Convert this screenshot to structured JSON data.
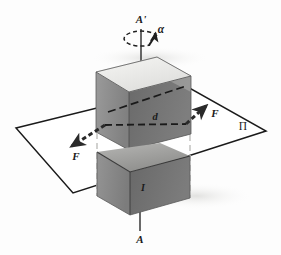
{
  "figure": {
    "background_color": "#fdfdfd",
    "width": 281,
    "height": 255
  },
  "labels": {
    "axis_top": "A'",
    "axis_bottom": "A",
    "angle": "α",
    "force_left": "F",
    "force_right": "F",
    "distance": "d",
    "current": "I",
    "plane": "Π"
  },
  "label_positions": {
    "axis_top": {
      "x": 141,
      "y": 20,
      "size": 11
    },
    "axis_bottom": {
      "x": 140,
      "y": 240,
      "size": 11
    },
    "angle": {
      "x": 159,
      "y": 31,
      "size": 11
    },
    "force_left": {
      "x": 76,
      "y": 157,
      "size": 11
    },
    "force_right": {
      "x": 215,
      "y": 115,
      "size": 11
    },
    "distance": {
      "x": 155,
      "y": 119,
      "size": 11
    },
    "current": {
      "x": 143,
      "y": 189,
      "size": 10
    },
    "plane": {
      "x": 243,
      "y": 127,
      "size": 11
    }
  },
  "colors": {
    "outline": "#1a1a1a",
    "box_top_face": "#e8e8e6",
    "box_top_face_highlight": "#f2f2f0",
    "box_front_left_face": "#8c8c8c",
    "box_front_right_face": "#6e6e6e",
    "box_inner_back_left": "#9a9a9a",
    "box_inner_back_right": "#7a7a7a",
    "box_inner_floor": "#b4b4b2",
    "box_lower_front_left": "#8a8a8a",
    "box_lower_front_right": "#6a6a6a",
    "box_lower_inner": "#a6a6a4",
    "plane_fill": "#ffffff",
    "plane_stroke": "#1a1a1a",
    "guide_dash": "#c9c9c7",
    "hidden_dash": "#1a1a1a",
    "arrow_fill": "#2a2a2a",
    "axis_line": "#2a2a2a",
    "shadow": "#e4e4e2"
  },
  "geometry": {
    "axis": {
      "top_point": {
        "x": 141,
        "y": 29
      },
      "bottom_point": {
        "x": 140,
        "y": 231
      }
    },
    "plane_polygon": [
      {
        "x": 16,
        "y": 128
      },
      {
        "x": 186,
        "y": 86
      },
      {
        "x": 266,
        "y": 131
      },
      {
        "x": 73,
        "y": 193
      }
    ],
    "box_upper": {
      "top_face": [
        {
          "x": 96,
          "y": 72
        },
        {
          "x": 157,
          "y": 57
        },
        {
          "x": 191,
          "y": 76
        },
        {
          "x": 129,
          "y": 92
        }
      ],
      "front_left_face": [
        {
          "x": 96,
          "y": 72
        },
        {
          "x": 129,
          "y": 92
        },
        {
          "x": 129,
          "y": 150
        },
        {
          "x": 96,
          "y": 132
        }
      ],
      "front_right_face": [
        {
          "x": 129,
          "y": 92
        },
        {
          "x": 191,
          "y": 76
        },
        {
          "x": 191,
          "y": 134
        },
        {
          "x": 129,
          "y": 150
        }
      ]
    },
    "box_lower": {
      "front_left_face": [
        {
          "x": 96,
          "y": 152
        },
        {
          "x": 129,
          "y": 172
        },
        {
          "x": 129,
          "y": 215
        },
        {
          "x": 96,
          "y": 196
        }
      ],
      "front_right_face": [
        {
          "x": 129,
          "y": 172
        },
        {
          "x": 191,
          "y": 156
        },
        {
          "x": 191,
          "y": 198
        },
        {
          "x": 129,
          "y": 215
        }
      ]
    },
    "force_left_arrow": {
      "from": {
        "x": 105,
        "y": 125
      },
      "to": {
        "x": 69,
        "y": 148
      }
    },
    "force_right_arrow": {
      "from": {
        "x": 186,
        "y": 124
      },
      "to": {
        "x": 208,
        "y": 104
      }
    },
    "rotation_arc": {
      "center": {
        "x": 141,
        "y": 40
      },
      "rx": 17,
      "ry": 7
    }
  },
  "elements": [
    {
      "name": "rotation-axis",
      "kind": "line"
    },
    {
      "name": "rotation-arc-arrow",
      "kind": "arc"
    },
    {
      "name": "plane-pi",
      "kind": "polygon"
    },
    {
      "name": "open-box-upper",
      "kind": "solid"
    },
    {
      "name": "open-box-lower",
      "kind": "solid"
    },
    {
      "name": "force-vector-left",
      "kind": "arrow"
    },
    {
      "name": "force-vector-right",
      "kind": "arrow"
    },
    {
      "name": "distance-dashed-line",
      "kind": "dashed"
    },
    {
      "name": "guide-lines",
      "kind": "dashed"
    }
  ]
}
